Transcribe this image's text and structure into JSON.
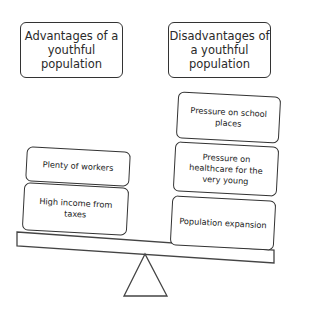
{
  "diagram": {
    "type": "seesaw-balance",
    "left": {
      "header": "Advantages of a youthful population",
      "items": [
        "Plenty of workers",
        "High income from taxes"
      ]
    },
    "right": {
      "header": "Disadvantages of a youthful population",
      "items": [
        "Pressure on school places",
        "Pressure on healthcare for the very young",
        "Population expansion"
      ]
    },
    "colors": {
      "stroke": "#333333",
      "fill": "#ffffff",
      "text": "#222222"
    }
  }
}
